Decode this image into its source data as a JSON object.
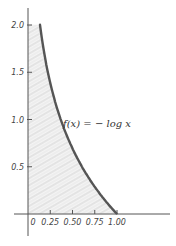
{
  "chart_data": {
    "type": "area",
    "title": "",
    "xlabel": "",
    "ylabel": "",
    "function_label": "f(x) = − log x",
    "xlim": [
      0,
      1.1
    ],
    "ylim": [
      0,
      2.1
    ],
    "x_ticks": [
      "0",
      "0.25",
      "0.50",
      "0.75",
      "1.00"
    ],
    "y_ticks": [
      "0.5",
      "1.0",
      "1.5",
      "2.0"
    ],
    "x_tick_values": [
      0,
      0.25,
      0.5,
      0.75,
      1.0
    ],
    "y_tick_values": [
      0.5,
      1.0,
      1.5,
      2.0
    ],
    "series": [
      {
        "name": "f(x) = -log x",
        "x": [
          0.14,
          0.2,
          0.25,
          0.3,
          0.4,
          0.5,
          0.6,
          0.7,
          0.8,
          0.9,
          1.0
        ],
        "values": [
          1.97,
          1.61,
          1.39,
          1.2,
          0.92,
          0.69,
          0.51,
          0.36,
          0.22,
          0.11,
          0.0
        ]
      }
    ],
    "shaded_region": "area under curve between x=0 and x=1",
    "grid": false,
    "legend": "none",
    "colors": {
      "curve": "#555555",
      "shading": "#bdbdbd",
      "axis": "#555555"
    }
  }
}
